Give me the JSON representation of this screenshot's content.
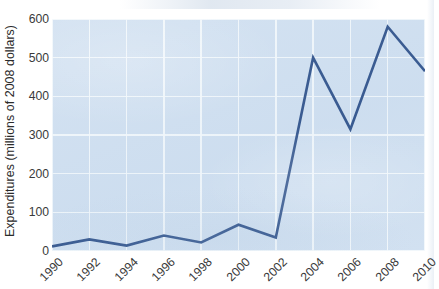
{
  "chart_data": {
    "type": "line",
    "title": "",
    "subtitle": "",
    "xlabel": "",
    "ylabel": "Expenditures (millions of 2008 dollars)",
    "x": [
      1990,
      1992,
      1994,
      1996,
      1998,
      2000,
      2002,
      2004,
      2006,
      2008,
      2010
    ],
    "categories": [
      "1990",
      "1992",
      "1994",
      "1996",
      "1998",
      "2000",
      "2002",
      "2004",
      "2006",
      "2008",
      "2010"
    ],
    "values": [
      12,
      30,
      14,
      40,
      22,
      68,
      35,
      500,
      315,
      580,
      465
    ],
    "series": [
      {
        "name": "Expenditures",
        "values": [
          12,
          30,
          14,
          40,
          22,
          68,
          35,
          500,
          315,
          580,
          465
        ]
      }
    ],
    "xlim": [
      1990,
      2010
    ],
    "ylim": [
      0,
      600
    ],
    "yticks": [
      0,
      100,
      200,
      300,
      400,
      500,
      600
    ],
    "ytick_labels": [
      "0",
      "100",
      "200",
      "300",
      "400",
      "500",
      "600"
    ],
    "xticks": [
      1990,
      1992,
      1994,
      1996,
      1998,
      2000,
      2002,
      2004,
      2006,
      2008,
      2010
    ],
    "xtick_labels": [
      "1990",
      "1992",
      "1994",
      "1996",
      "1998",
      "2000",
      "2002",
      "2004",
      "2006",
      "2008",
      "2010"
    ],
    "xtick_rotation_deg": -45,
    "grid": true,
    "grid_color": "#f4f8fc",
    "legend": false,
    "legend_position": "none",
    "annotations": [],
    "line_color": "#2a4d87",
    "line_width_px": 2.6,
    "markers": false,
    "plot_background": "#cfdff0",
    "figure_background": "#ffffff",
    "tick_label_color": "#3a3a3a",
    "axis_label_color": "#2b2b2b"
  }
}
